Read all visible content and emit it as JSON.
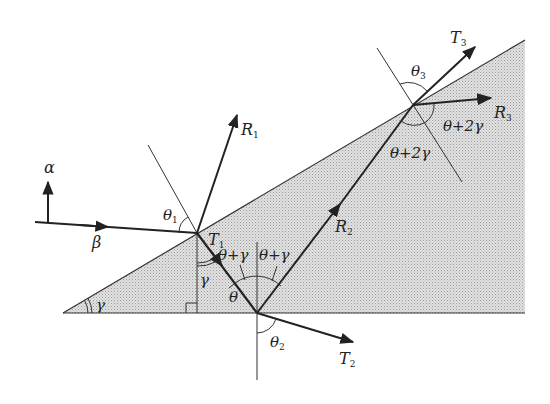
{
  "diagram": {
    "type": "optics-wedge-ray-diagram",
    "colors": {
      "background": "#ffffff",
      "wedge_fill": "#d9d9d9",
      "line": "#222222"
    },
    "labels": {
      "alpha": "α",
      "beta": "β",
      "gamma_apex": "γ",
      "gamma_inner": "γ",
      "theta": "θ",
      "theta1": "θ",
      "theta1_sub": "1",
      "theta2": "θ",
      "theta2_sub": "2",
      "theta3": "θ",
      "theta3_sub": "3",
      "R1": "R",
      "R1_sub": "1",
      "R2": "R",
      "R2_sub": "2",
      "R3": "R",
      "R3_sub": "3",
      "T1": "T",
      "T1_sub": "1",
      "T2": "T",
      "T2_sub": "2",
      "T3": "T",
      "T3_sub": "3",
      "theta_plus_gamma_left": "θ+γ",
      "theta_plus_gamma_right": "θ+γ",
      "theta_plus_2gamma_lower": "θ+2γ",
      "theta_plus_2gamma_right": "θ+2γ"
    }
  }
}
